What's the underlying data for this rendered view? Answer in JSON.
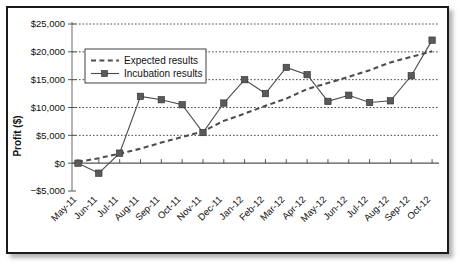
{
  "chart_data": {
    "type": "line",
    "title": "",
    "xlabel": "",
    "ylabel": "Profit ($)",
    "ylim": [
      -5000,
      25000
    ],
    "ytick_values": [
      25000,
      20000,
      15000,
      10000,
      5000,
      0,
      -5000
    ],
    "ytick_labels": [
      "$25,000",
      "$20,000",
      "$15,000",
      "$10,000",
      "$5,000",
      "$0",
      "−$5,000"
    ],
    "grid": true,
    "legend_position": "upper left",
    "categories": [
      "May-11",
      "Jun-11",
      "Jul-11",
      "Aug-11",
      "Sep-11",
      "Oct-11",
      "Nov-11",
      "Dec-11",
      "Jan-12",
      "Feb-12",
      "Mar-12",
      "Apr-12",
      "May-12",
      "Jun-12",
      "Jul-12",
      "Aug-12",
      "Sep-12",
      "Oct-12"
    ],
    "series": [
      {
        "name": "Expected results",
        "style": "dashed",
        "marker": "none",
        "values": [
          200,
          900,
          1700,
          2600,
          3700,
          4700,
          5700,
          7600,
          8900,
          10300,
          11600,
          13300,
          14400,
          15500,
          16700,
          18100,
          19100,
          20100
        ]
      },
      {
        "name": "Incubation results",
        "style": "solid",
        "marker": "square",
        "values": [
          0,
          -1800,
          1800,
          12000,
          11400,
          10500,
          5500,
          10800,
          15000,
          12500,
          17200,
          15900,
          11100,
          12200,
          10900,
          11200,
          15700,
          22100
        ]
      }
    ]
  },
  "legend": {
    "entries": [
      {
        "label": "Expected results"
      },
      {
        "label": "Incubation results"
      }
    ]
  },
  "colors": {
    "expected_line": "#4d4d4d",
    "incubation_line": "#4a4a4a",
    "marker_fill": "#5a5a5a",
    "gridline": "#333333",
    "frame_border": "#1a1a1a",
    "background": "#ffffff"
  }
}
